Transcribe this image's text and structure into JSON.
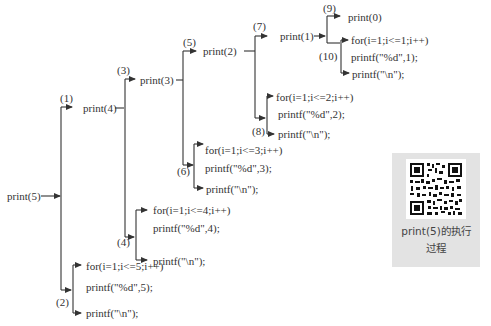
{
  "diagram": {
    "nodes": {
      "root": "print(5)",
      "n1": "print(4)",
      "n3": "print(3)",
      "n5": "print(2)",
      "n7": "print(1)",
      "n9": "print(0)"
    },
    "labels": {
      "l1": "(1)",
      "l2": "(2)",
      "l3": "(3)",
      "l4": "(4)",
      "l5": "(5)",
      "l6": "(6)",
      "l7": "(7)",
      "l8": "(8)",
      "l9": "(9)",
      "l10": "(10)"
    },
    "blocks": {
      "b10": {
        "for": "for(i=1;i<=1;i++)",
        "printd": "printf(\"%d\",1);",
        "newline": "printf(\"\\n\");"
      },
      "b8": {
        "for": "for(i=1;i<=2;i++)",
        "printd": "printf(\"%d\",2);",
        "newline": "printf(\"\\n\");"
      },
      "b6": {
        "for": "for(i=1;i<=3;i++)",
        "printd": "printf(\"%d\",3);",
        "newline": "printf(\"\\n\");"
      },
      "b4": {
        "for": "for(i=1;i<=4;i++)",
        "printd": "printf(\"%d\",4);",
        "newline": "printf(\"\\n\");"
      },
      "b2": {
        "for": "for(i=1;i<=5;i++)",
        "printd": "printf(\"%d\",5);",
        "newline": "printf(\"\\n\");"
      }
    }
  },
  "qr_card": {
    "icon": "qr-code-icon",
    "caption_line1": "print(5)的执行",
    "caption_line2": "过程"
  }
}
